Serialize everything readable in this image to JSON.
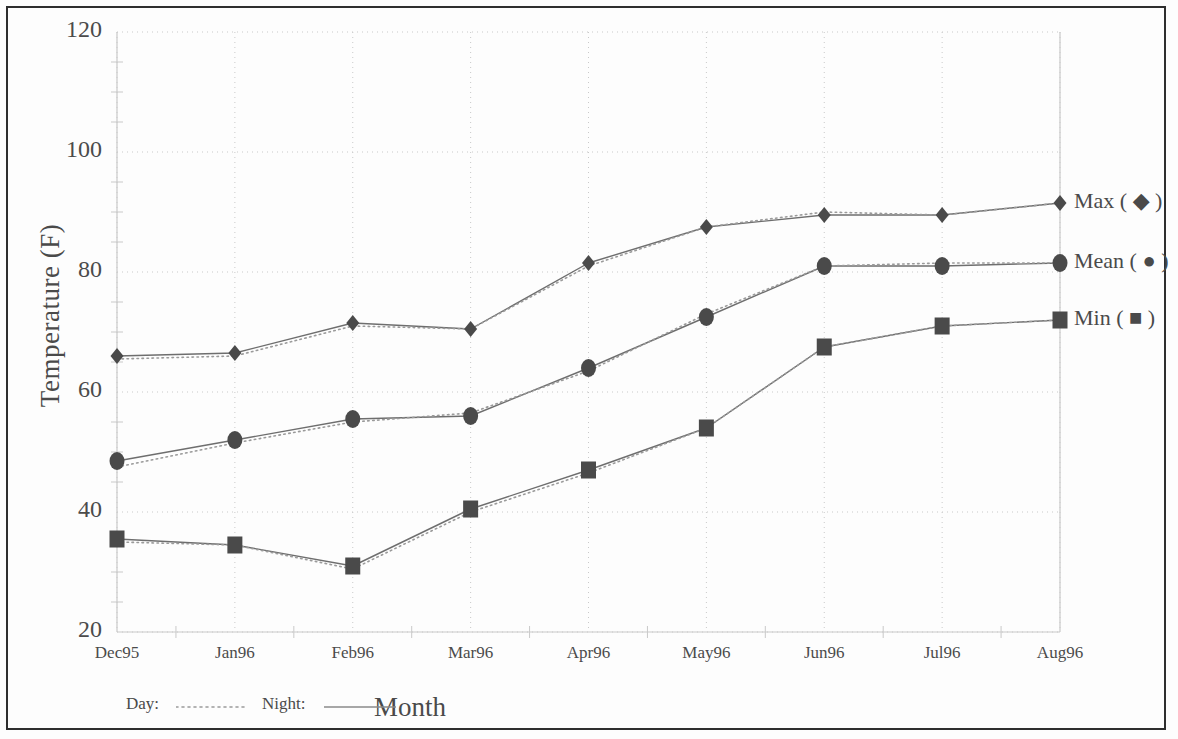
{
  "chart_data": {
    "type": "line",
    "title": "",
    "xlabel": "Month",
    "ylabel": "Temperature (F)",
    "categories": [
      "Dec95",
      "Jan96",
      "Feb96",
      "Mar96",
      "Apr96",
      "May96",
      "Jun96",
      "Jul96",
      "Aug96"
    ],
    "ylim": [
      20,
      120
    ],
    "ytick_labels": [
      "120",
      "100",
      "80",
      "60",
      "40",
      "20"
    ],
    "ytick_values": [
      120,
      100,
      80,
      60,
      40,
      20
    ],
    "yminor_step": 5,
    "grid": true,
    "grid_style": "dotted",
    "legend_position": "right",
    "series": [
      {
        "name": "Max",
        "marker": "diamond",
        "condition": "Night",
        "line": "solid",
        "values": [
          66,
          66.5,
          71.5,
          70.5,
          81.5,
          87.5,
          89.5,
          89.5,
          91.5
        ]
      },
      {
        "name": "Max",
        "marker": "diamond",
        "condition": "Day",
        "line": "dotted",
        "values": [
          65.5,
          66,
          71,
          70.5,
          81,
          87.5,
          90,
          89.5,
          91.5
        ]
      },
      {
        "name": "Mean",
        "marker": "circle",
        "condition": "Night",
        "line": "solid",
        "values": [
          48.5,
          52,
          55.5,
          56,
          64,
          72.5,
          81,
          81,
          81.5
        ]
      },
      {
        "name": "Mean",
        "marker": "circle",
        "condition": "Day",
        "line": "dotted",
        "values": [
          47.5,
          51.5,
          55,
          56.5,
          63.5,
          73,
          81,
          81.5,
          81.5
        ]
      },
      {
        "name": "Min",
        "marker": "square",
        "condition": "Night",
        "line": "solid",
        "values": [
          35.5,
          34.5,
          31,
          40.5,
          47,
          54,
          67.5,
          71,
          72
        ]
      },
      {
        "name": "Min",
        "marker": "square",
        "condition": "Day",
        "line": "dotted",
        "values": [
          35,
          34.5,
          30.5,
          40,
          46.5,
          54,
          67.5,
          71,
          72
        ]
      }
    ]
  },
  "legend": {
    "items": [
      {
        "label": "Max ( ◆ )",
        "marker": "diamond",
        "value_at_end": 91.5
      },
      {
        "label": "Mean ( ● )",
        "marker": "circle",
        "value_at_end": 81.5
      },
      {
        "label": "Min ( ■ )",
        "marker": "square",
        "value_at_end": 72
      }
    ]
  },
  "line_key": {
    "day_label": "Day:",
    "night_label": "Night:"
  },
  "colors": {
    "marker": "#4a4a4a",
    "line": "#6e6e6e",
    "grid": "#c9c9c9",
    "text": "#4a4a4a",
    "frame": "#2e2e2e"
  }
}
